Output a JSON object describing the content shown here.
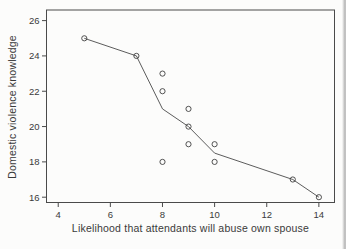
{
  "figure": {
    "background": "#fcfcfb",
    "text_color": "#3a3a3a",
    "line_color": "#4a4a4a",
    "marker_color": "#3f3f3f",
    "page_edge_color": "#b5b5b5"
  },
  "chart_data": {
    "type": "scatter",
    "title": "",
    "xlabel": "Likelihood that attendants will abuse own spouse",
    "ylabel": "Domestic violence knowledge",
    "xlim": [
      3.55,
      14.6
    ],
    "ylim": [
      15.7,
      26.6
    ],
    "xticks": [
      4,
      6,
      8,
      10,
      12,
      14
    ],
    "yticks": [
      16,
      18,
      20,
      22,
      24,
      26
    ],
    "grid": false,
    "legend": "none",
    "marker": "open-circle",
    "series": [
      {
        "name": "observations",
        "type": "scatter",
        "points": [
          [
            5,
            25
          ],
          [
            7,
            24
          ],
          [
            8,
            23
          ],
          [
            8,
            22
          ],
          [
            8,
            18
          ],
          [
            9,
            21
          ],
          [
            9,
            20
          ],
          [
            9,
            19
          ],
          [
            10,
            19
          ],
          [
            10,
            18
          ],
          [
            13,
            17
          ],
          [
            14,
            16
          ]
        ]
      },
      {
        "name": "mean-trace",
        "type": "line",
        "points": [
          [
            5,
            25
          ],
          [
            7,
            24
          ],
          [
            8,
            21
          ],
          [
            9,
            20
          ],
          [
            10,
            18.5
          ],
          [
            13,
            17
          ],
          [
            14,
            16
          ]
        ]
      }
    ]
  }
}
